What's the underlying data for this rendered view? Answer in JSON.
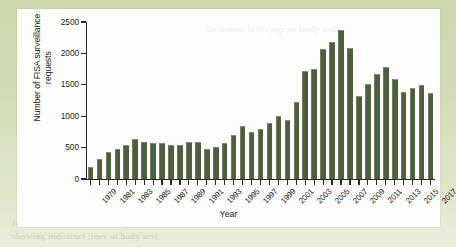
{
  "page": {
    "background_color": "#cdd9b0",
    "panel_color": "#fdfdfb",
    "bleed_text": [
      "the contents of this page are faintly visible",
      "from the reverse side of the printed sheet",
      "showing indistinct lines of body text"
    ]
  },
  "chart_data": {
    "type": "bar",
    "title": "",
    "xlabel": "Year",
    "ylabel": "Number of FISA surveillance requests",
    "ylim": [
      0,
      2500
    ],
    "yticks": [
      0,
      500,
      1000,
      1500,
      2000,
      2500
    ],
    "ytick_labels": [
      "0",
      "500",
      "1000",
      "1500",
      "2000",
      "2500"
    ],
    "grid": false,
    "legend": "none",
    "bar_color": "#4c6040",
    "xtick_labels": [
      "1979",
      "1981",
      "1983",
      "1985",
      "1987",
      "1989",
      "1991",
      "1993",
      "1995",
      "1997",
      "1999",
      "2001",
      "2003",
      "2005",
      "2007",
      "2009",
      "2011",
      "2013",
      "2015",
      "2017"
    ],
    "categories": [
      "1979",
      "1980",
      "1981",
      "1982",
      "1983",
      "1984",
      "1985",
      "1986",
      "1987",
      "1988",
      "1989",
      "1990",
      "1991",
      "1992",
      "1993",
      "1994",
      "1995",
      "1996",
      "1997",
      "1998",
      "1999",
      "2000",
      "2001",
      "2002",
      "2003",
      "2004",
      "2005",
      "2006",
      "2007",
      "2008",
      "2009",
      "2010",
      "2011",
      "2012",
      "2013",
      "2014",
      "2015",
      "2016",
      "2017"
    ],
    "values": [
      199,
      319,
      431,
      473,
      549,
      635,
      587,
      573,
      571,
      534,
      546,
      595,
      593,
      484,
      509,
      576,
      697,
      839,
      749,
      796,
      886,
      1005,
      932,
      1228,
      1727,
      1758,
      2072,
      2176,
      2371,
      2082,
      1329,
      1511,
      1676,
      1789,
      1588,
      1379,
      1457,
      1499,
      1372
    ]
  }
}
